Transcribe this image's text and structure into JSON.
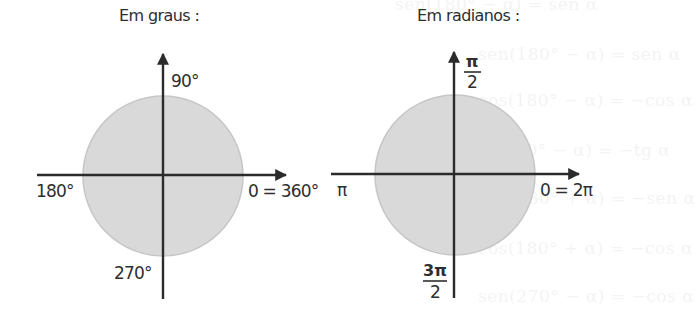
{
  "background_show_through": [
    "sen(180° − α) = sen α",
    "cos(180° − α) = −cos α",
    "tg(180° − α) = −tg α",
    "sen(180° + α) = −sen α",
    "cos(180° + α) = −cos α",
    "sen(270° − α) = −cos α"
  ],
  "diagrams": [
    {
      "title": "Em graus :",
      "labels": {
        "top": "90°",
        "left": "180°",
        "right": "0 = 360°",
        "bottom": "270°"
      }
    },
    {
      "title": "Em radianos :",
      "labels": {
        "top_num": "π",
        "top_den": "2",
        "left": "π",
        "right": "0 = 2π",
        "bottom_num": "3π",
        "bottom_den": "2"
      }
    }
  ],
  "colors": {
    "circle_fill": "#d9d9d9",
    "circle_edge": "#c6c6c6",
    "axis": "#2b2b2b",
    "text": "#2e2e2e"
  }
}
